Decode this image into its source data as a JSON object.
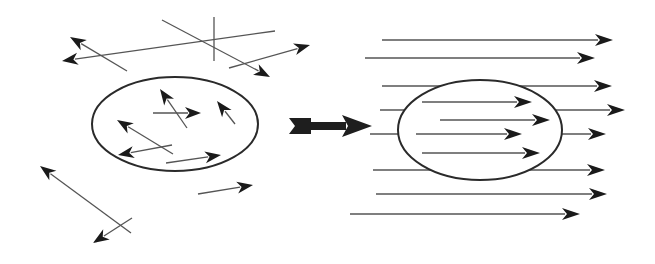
{
  "diagram": {
    "title": "",
    "colors": {
      "background": "#ffffff",
      "line": "#555555",
      "head": "#1a1a1a",
      "boundary": "#2a2a2a",
      "transition_arrow": "#1e1e1e"
    },
    "left_panel": {
      "label": "random orientation",
      "boundary": {
        "cx": 175,
        "cy": 124,
        "rx": 83,
        "ry": 47
      },
      "outside_vectors": [
        {
          "x1": 127,
          "y1": 71,
          "x2": 70,
          "y2": 37,
          "head": true
        },
        {
          "x1": 275,
          "y1": 31,
          "x2": 62,
          "y2": 61,
          "head": true
        },
        {
          "x1": 162,
          "y1": 20,
          "x2": 270,
          "y2": 77,
          "head": true
        },
        {
          "x1": 214,
          "y1": 17,
          "x2": 214,
          "y2": 61,
          "head": false
        },
        {
          "x1": 229,
          "y1": 68,
          "x2": 310,
          "y2": 45,
          "head": true
        },
        {
          "x1": 198,
          "y1": 194,
          "x2": 253,
          "y2": 185,
          "head": true
        },
        {
          "x1": 131,
          "y1": 233,
          "x2": 40,
          "y2": 166,
          "head": true
        },
        {
          "x1": 132,
          "y1": 218,
          "x2": 93,
          "y2": 243,
          "head": true
        }
      ],
      "inside_vectors": [
        {
          "x1": 187,
          "y1": 128,
          "x2": 160,
          "y2": 89,
          "head": true
        },
        {
          "x1": 153,
          "y1": 113,
          "x2": 201,
          "y2": 113,
          "head": true
        },
        {
          "x1": 235,
          "y1": 124,
          "x2": 217,
          "y2": 101,
          "head": true
        },
        {
          "x1": 173,
          "y1": 154,
          "x2": 117,
          "y2": 120,
          "head": true
        },
        {
          "x1": 172,
          "y1": 145,
          "x2": 118,
          "y2": 155,
          "head": true
        },
        {
          "x1": 166,
          "y1": 163,
          "x2": 221,
          "y2": 155,
          "head": true
        }
      ]
    },
    "transition_arrow": {
      "x1": 289,
      "y1": 126,
      "x2": 372,
      "y2": 126,
      "label": "alignment"
    },
    "right_panel": {
      "label": "aligned orientation",
      "boundary": {
        "cx": 480,
        "cy": 130,
        "rx": 82,
        "ry": 50
      },
      "field_lines": [
        {
          "x1": 382,
          "y1": 40,
          "x2": 613,
          "y2": 40,
          "head": true
        },
        {
          "x1": 365,
          "y1": 58,
          "x2": 595,
          "y2": 58,
          "head": true
        },
        {
          "x1": 382,
          "y1": 86,
          "x2": 612,
          "y2": 86,
          "head": true
        },
        {
          "x1": 380,
          "y1": 110,
          "x2": 625,
          "y2": 110,
          "head": true
        },
        {
          "x1": 370,
          "y1": 134,
          "x2": 606,
          "y2": 134,
          "head": true
        },
        {
          "x1": 373,
          "y1": 170,
          "x2": 605,
          "y2": 170,
          "head": true
        },
        {
          "x1": 376,
          "y1": 194,
          "x2": 607,
          "y2": 194,
          "head": true
        },
        {
          "x1": 350,
          "y1": 214,
          "x2": 580,
          "y2": 214,
          "head": true
        }
      ],
      "inside_vectors": [
        {
          "x1": 422,
          "y1": 102,
          "x2": 532,
          "y2": 102,
          "head": true
        },
        {
          "x1": 440,
          "y1": 120,
          "x2": 550,
          "y2": 120,
          "head": true
        },
        {
          "x1": 416,
          "y1": 134,
          "x2": 522,
          "y2": 134,
          "head": true
        },
        {
          "x1": 422,
          "y1": 153,
          "x2": 540,
          "y2": 153,
          "head": true
        }
      ]
    }
  }
}
